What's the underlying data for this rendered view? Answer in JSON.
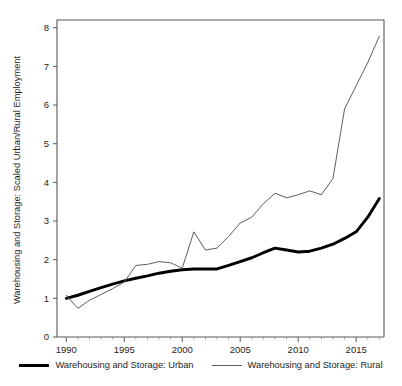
{
  "chart_data": {
    "type": "line",
    "title": "",
    "xlabel": "",
    "ylabel": "Warehousing and Storage: Scaled Urban/Rural Employment",
    "xlim": [
      1989.2,
      2017.4
    ],
    "ylim": [
      0,
      8.2
    ],
    "xticks": [
      1990,
      1995,
      2000,
      2005,
      2010,
      2015
    ],
    "xtick_labels": [
      "1990",
      "1995",
      "2000",
      "2005",
      "2010",
      "2015"
    ],
    "yticks": [
      0,
      1,
      2,
      3,
      4,
      5,
      6,
      7,
      8
    ],
    "ytick_labels": [
      "0",
      "1",
      "2",
      "3",
      "4",
      "5",
      "6",
      "7",
      "8"
    ],
    "grid": false,
    "minor_xticks": true,
    "legend_position": "below-center",
    "x": [
      1990,
      1991,
      1992,
      1993,
      1994,
      1995,
      1996,
      1997,
      1998,
      1999,
      2000,
      2001,
      2002,
      2003,
      2004,
      2005,
      2006,
      2007,
      2008,
      2009,
      2010,
      2011,
      2012,
      2013,
      2014,
      2015,
      2016,
      2017
    ],
    "series": [
      {
        "name": "Warehousing and Storage: Urban",
        "color": "#000000",
        "linewidth": 2.9,
        "values": [
          1.0,
          1.08,
          1.18,
          1.28,
          1.37,
          1.45,
          1.52,
          1.58,
          1.65,
          1.7,
          1.74,
          1.76,
          1.76,
          1.76,
          1.85,
          1.95,
          2.05,
          2.18,
          2.3,
          2.25,
          2.2,
          2.22,
          2.3,
          2.4,
          2.55,
          2.72,
          3.1,
          3.58
        ]
      },
      {
        "name": "Warehousing and Storage: Rural",
        "color": "#5d5d5d",
        "linewidth": 1.0,
        "values": [
          1.08,
          0.74,
          0.95,
          1.1,
          1.25,
          1.42,
          1.85,
          1.88,
          1.95,
          1.92,
          1.78,
          2.72,
          2.25,
          2.3,
          2.6,
          2.95,
          3.1,
          3.45,
          3.72,
          3.6,
          3.68,
          3.78,
          3.68,
          4.1,
          5.9,
          6.5,
          7.1,
          7.78
        ]
      }
    ]
  },
  "legend": {
    "items": [
      {
        "label": "Warehousing and Storage: Urban",
        "style": "thick-black"
      },
      {
        "label": "Warehousing and Storage: Rural",
        "style": "thin-gray"
      }
    ]
  }
}
